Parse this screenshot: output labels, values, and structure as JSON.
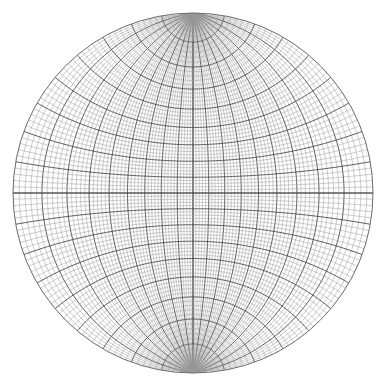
{
  "diagram": {
    "type": "stereonet",
    "projection": "equal-angle (Wulff) meridional net",
    "center": [
      193,
      193
    ],
    "radius": 180,
    "minor_interval_deg": 2,
    "major_interval_deg": 10,
    "polar_cap_deg": 10,
    "colors": {
      "background": "#ffffff",
      "minor_line": "#9a9a9a",
      "major_line": "#4a4a4a",
      "primitive": "#6a6a6a"
    }
  }
}
